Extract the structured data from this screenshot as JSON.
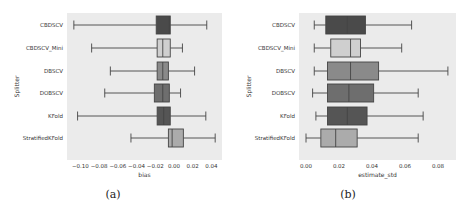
{
  "chart_data": [
    {
      "type": "boxplot",
      "orientation": "horizontal",
      "caption": "(a)",
      "xlabel": "bias",
      "ylabel": "Splitter",
      "xlim": [
        -0.115,
        0.052
      ],
      "xticks": [
        -0.1,
        -0.08,
        -0.06,
        -0.04,
        -0.02,
        0.0,
        0.02,
        0.04
      ],
      "xtick_labels": [
        "−0.10",
        "−0.08",
        "−0.06",
        "−0.04",
        "−0.02",
        "0.00",
        "0.02",
        "0.04"
      ],
      "grid": false,
      "categories": [
        "CBDSCV",
        "CBDSCV_Mini",
        "DBSCV",
        "DOBSCV",
        "KFold",
        "StratifiedKFold"
      ],
      "series": [
        {
          "name": "CBDSCV",
          "whisker_low": -0.107,
          "q1": -0.019,
          "median": -0.005,
          "q3": -0.004,
          "whisker_high": 0.035,
          "color": "#4a4a4a"
        },
        {
          "name": "CBDSCV_Mini",
          "whisker_low": -0.088,
          "q1": -0.018,
          "median": -0.012,
          "q3": -0.004,
          "whisker_high": 0.009,
          "color": "#cfcfcf"
        },
        {
          "name": "DBSCV",
          "whisker_low": -0.068,
          "q1": -0.018,
          "median": -0.012,
          "q3": -0.006,
          "whisker_high": 0.022,
          "color": "#8a8a8a"
        },
        {
          "name": "DOBSCV",
          "whisker_low": -0.074,
          "q1": -0.021,
          "median": -0.012,
          "q3": -0.005,
          "whisker_high": 0.007,
          "color": "#6e6e6e"
        },
        {
          "name": "KFold",
          "whisker_low": -0.103,
          "q1": -0.018,
          "median": -0.011,
          "q3": -0.004,
          "whisker_high": 0.034,
          "color": "#555555"
        },
        {
          "name": "StratifiedKFold",
          "whisker_low": -0.046,
          "q1": -0.006,
          "median": -0.002,
          "q3": 0.01,
          "whisker_high": 0.044,
          "color": "#ababab"
        }
      ]
    },
    {
      "type": "boxplot",
      "orientation": "horizontal",
      "caption": "(b)",
      "xlabel": "estimate_std",
      "ylabel": "Splitter",
      "xlim": [
        -0.003,
        0.092
      ],
      "xticks": [
        0.0,
        0.02,
        0.04,
        0.06,
        0.08
      ],
      "xtick_labels": [
        "0.00",
        "0.02",
        "0.04",
        "0.06",
        "0.08"
      ],
      "grid": false,
      "categories": [
        "CBDSCV",
        "CBDSCV_Mini",
        "DBSCV",
        "DOBSCV",
        "KFold",
        "StratifiedKFold"
      ],
      "series": [
        {
          "name": "CBDSCV",
          "whisker_low": 0.005,
          "q1": 0.012,
          "median": 0.025,
          "q3": 0.036,
          "whisker_high": 0.064,
          "color": "#4a4a4a"
        },
        {
          "name": "CBDSCV_Mini",
          "whisker_low": 0.005,
          "q1": 0.015,
          "median": 0.027,
          "q3": 0.033,
          "whisker_high": 0.058,
          "color": "#cfcfcf"
        },
        {
          "name": "DBSCV",
          "whisker_low": 0.005,
          "q1": 0.013,
          "median": 0.027,
          "q3": 0.044,
          "whisker_high": 0.086,
          "color": "#8a8a8a"
        },
        {
          "name": "DOBSCV",
          "whisker_low": 0.004,
          "q1": 0.013,
          "median": 0.026,
          "q3": 0.041,
          "whisker_high": 0.068,
          "color": "#6e6e6e"
        },
        {
          "name": "KFold",
          "whisker_low": 0.006,
          "q1": 0.013,
          "median": 0.025,
          "q3": 0.037,
          "whisker_high": 0.071,
          "color": "#555555"
        },
        {
          "name": "StratifiedKFold",
          "whisker_low": 0.0,
          "q1": 0.009,
          "median": 0.018,
          "q3": 0.031,
          "whisker_high": 0.068,
          "color": "#ababab"
        }
      ]
    }
  ],
  "layout": [
    {
      "plot_left": 67,
      "plot_top": 13,
      "plot_width": 155,
      "plot_height": 147,
      "zero_px": 174,
      "px_per_unit": 936,
      "label_right": 63,
      "ylabel_x": 14,
      "tick_y": 163,
      "xlabel_y": 171,
      "caption_x": 113,
      "caption_y": 188
    },
    {
      "plot_left": 299,
      "plot_top": 13,
      "plot_width": 157,
      "plot_height": 147,
      "zero_px": 306,
      "px_per_unit": 1650,
      "label_right": 295,
      "ylabel_x": 246,
      "tick_y": 163,
      "xlabel_y": 171,
      "caption_x": 348,
      "caption_y": 188
    }
  ],
  "row_centers": [
    25,
    48,
    71,
    93,
    116,
    138
  ],
  "box_height": 18,
  "colors": {
    "plot_background": "#ebebeb",
    "line": "#444444"
  }
}
